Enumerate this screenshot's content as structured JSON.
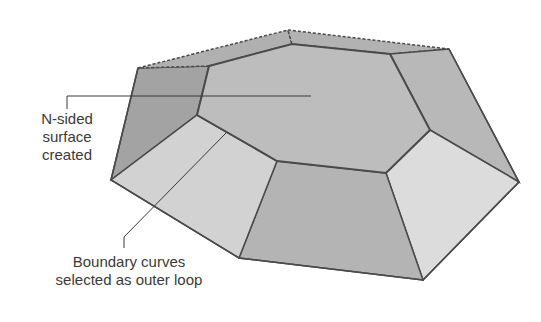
{
  "figure": {
    "colors": {
      "background": "#ffffff",
      "edge": "#4a4a4a",
      "top_face": "#bdbdbd",
      "face_dark": "#a0a0a0",
      "face_mid": "#b4b4b4",
      "face_light": "#d4d4d4",
      "face_lightest": "#dcdcdc",
      "label_text": "#3a3a3a",
      "leader_line": "#3a3a3a"
    }
  },
  "annotations": {
    "nsided": {
      "line1": "N-sided",
      "line2": "surface",
      "line3": "created"
    },
    "boundary": {
      "line1": "Boundary curves",
      "line2": "selected as outer loop"
    }
  }
}
